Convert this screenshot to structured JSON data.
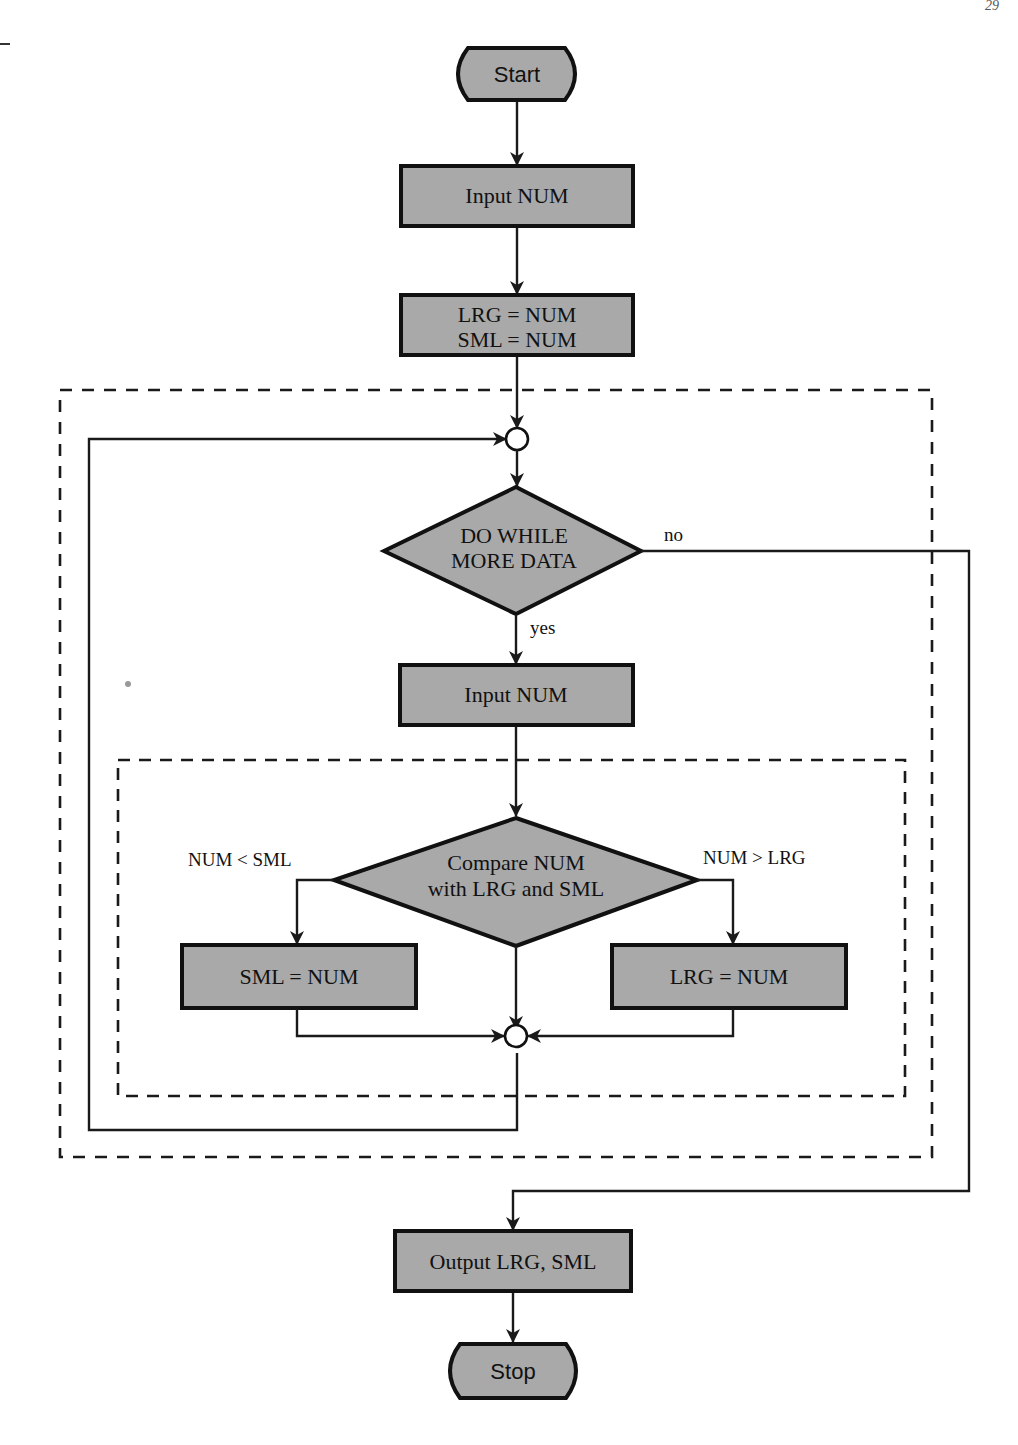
{
  "page": {
    "header_left": "",
    "page_number": "29"
  },
  "flowchart": {
    "start": "Start",
    "input_first": "Input NUM",
    "init_line1": "LRG = NUM",
    "init_line2": "SML = NUM",
    "loop_decision_line1": "DO WHILE",
    "loop_decision_line2": "MORE DATA",
    "loop_yes": "yes",
    "loop_no": "no",
    "input_loop": "Input NUM",
    "compare_line1": "Compare NUM",
    "compare_line2": "with LRG and SML",
    "branch_less": "NUM < SML",
    "branch_greater": "NUM > LRG",
    "set_small": "SML = NUM",
    "set_large": "LRG = NUM",
    "output": "Output LRG, SML",
    "stop": "Stop"
  },
  "colors": {
    "shape_fill": "#a9a9a9",
    "stroke": "#111111",
    "background": "#ffffff"
  }
}
